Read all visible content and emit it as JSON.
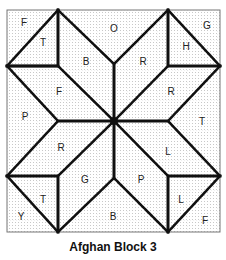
{
  "caption": "Afghan Block 3",
  "colors": {
    "line": "#111111",
    "grid": "#bdbdbd",
    "background": "#ffffff"
  },
  "regions": [
    {
      "label": "F",
      "x": 24,
      "y": 23
    },
    {
      "label": "T",
      "x": 43,
      "y": 43
    },
    {
      "label": "O",
      "x": 114,
      "y": 29
    },
    {
      "label": "G",
      "x": 207,
      "y": 26
    },
    {
      "label": "H",
      "x": 186,
      "y": 47
    },
    {
      "label": "B",
      "x": 86,
      "y": 62
    },
    {
      "label": "R",
      "x": 143,
      "y": 62
    },
    {
      "label": "F",
      "x": 59,
      "y": 92
    },
    {
      "label": "R",
      "x": 171,
      "y": 92
    },
    {
      "label": "P",
      "x": 25,
      "y": 117
    },
    {
      "label": "T",
      "x": 202,
      "y": 122
    },
    {
      "label": "R",
      "x": 61,
      "y": 148
    },
    {
      "label": "L",
      "x": 168,
      "y": 152
    },
    {
      "label": "G",
      "x": 85,
      "y": 180
    },
    {
      "label": "P",
      "x": 141,
      "y": 180
    },
    {
      "label": "T",
      "x": 43,
      "y": 200
    },
    {
      "label": "L",
      "x": 181,
      "y": 200
    },
    {
      "label": "Y",
      "x": 21,
      "y": 217
    },
    {
      "label": "B",
      "x": 113,
      "y": 217
    },
    {
      "label": "F",
      "x": 205,
      "y": 221
    }
  ]
}
